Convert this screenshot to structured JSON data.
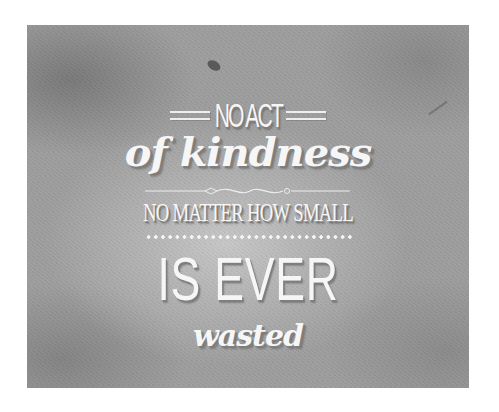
{
  "poster": {
    "background_color": "#9e9e9e",
    "text_color": "#f6f6f6",
    "lines": [
      "NO ACT",
      "of kindness",
      "NO MATTER HOW SMALL",
      "IS EVER",
      "wasted"
    ]
  }
}
